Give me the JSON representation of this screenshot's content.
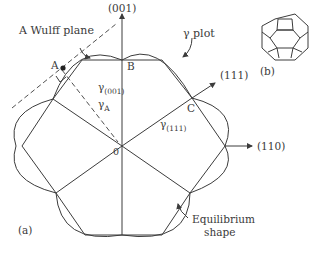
{
  "figure": {
    "panel_a_label": "(a)",
    "panel_b_label": "(b)"
  },
  "labels": {
    "wulff_plane": "A Wulff plane",
    "gamma_plot": "γ plot",
    "equilibrium_shape_line1": "Equilibrium",
    "equilibrium_shape_line2": "shape",
    "dir_001": "(001)",
    "dir_111": "(111)",
    "dir_110": "(110)",
    "point_a": "A",
    "point_b": "B",
    "point_c": "C",
    "origin": "0",
    "gamma_001_sym": "γ",
    "gamma_001_sub": "(001)",
    "gamma_111_sym": "γ",
    "gamma_111_sub": "(111)",
    "gamma_a_sym": "γ",
    "gamma_a_sub": "A"
  },
  "colors": {
    "line": "#3c3c3c",
    "text": "#3a3a3a",
    "background": "#ffffff"
  }
}
